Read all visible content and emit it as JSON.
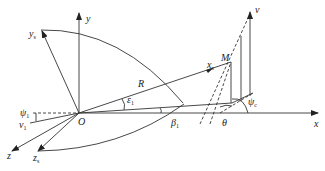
{
  "diagram": {
    "type": "geometry / coordinate-frame diagram",
    "origin": {
      "label": "O"
    },
    "axes": [
      {
        "id": "x",
        "label": "x"
      },
      {
        "id": "y",
        "label": "y"
      },
      {
        "id": "z",
        "label": "z"
      },
      {
        "id": "xs",
        "label": "x",
        "sub": "s"
      },
      {
        "id": "ys",
        "label": "y",
        "sub": "s"
      },
      {
        "id": "zs",
        "label": "z",
        "sub": "s"
      }
    ],
    "points": [
      {
        "id": "M",
        "label": "M"
      }
    ],
    "vectors": [
      {
        "id": "v",
        "label": "v"
      },
      {
        "id": "v1",
        "label": "v",
        "sub": "1"
      }
    ],
    "lengths": [
      {
        "id": "R",
        "label": "R"
      }
    ],
    "angles": [
      {
        "id": "eps1",
        "label": "ε",
        "sub": "1"
      },
      {
        "id": "psi1",
        "label": "ψ",
        "sub": "1"
      },
      {
        "id": "beta1",
        "label": "β",
        "sub": "1"
      },
      {
        "id": "theta",
        "label": "θ"
      },
      {
        "id": "psic",
        "label": "ψ",
        "sub": "c"
      }
    ],
    "colors": {
      "line": "#333333",
      "background": "#ffffff"
    }
  }
}
